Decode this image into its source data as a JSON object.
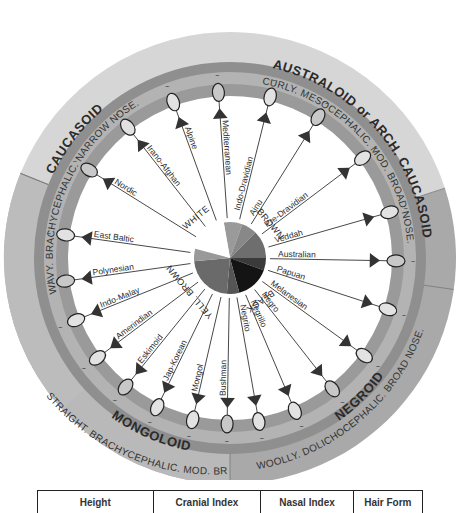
{
  "diagram": {
    "type": "circular race classification wheel",
    "center": [
      230,
      258
    ],
    "sectors": [
      {
        "id": "caucasoid",
        "title": "CAUCASOID",
        "description": "WAVY. BRACHYCEPHALIC. NARROW NOSE.",
        "color": "#d6d6d6",
        "start": -158,
        "end": -18
      },
      {
        "id": "australoid",
        "title": "AUSTRALOID or ARCH. CAUCASOID",
        "description": "CURLY. MESOCEPHALIC. MOD. BROAD NOSE.",
        "color": "#a9a9a9",
        "start": -18,
        "end": 90
      },
      {
        "id": "negroid",
        "title": "NEGROID",
        "description": "WOOLLY. DOLICHOCEPHALIC. BROAD NOSE.",
        "color": "#b9b9b9",
        "start": 90,
        "end": 180
      },
      {
        "id": "mongoloid",
        "title": "MONGOLOID",
        "description": "STRAIGHT. BRACHYCEPHALIC. MOD. BROAD NOSE",
        "color": "#bcbcbc",
        "start": 180,
        "end": 202
      }
    ],
    "skin_groups": [
      {
        "label": "WHITE"
      },
      {
        "label": "BROWN"
      },
      {
        "label": "BLACK"
      },
      {
        "label": "YELL. BROWN"
      }
    ],
    "races": [
      {
        "name": "Mediterranean",
        "group": "WHITE",
        "angle": -94
      },
      {
        "name": "Alpine",
        "group": "WHITE",
        "angle": -110
      },
      {
        "name": "Irano-Afghan",
        "group": "WHITE",
        "angle": -128
      },
      {
        "name": "Nordic",
        "group": "WHITE",
        "angle": -148
      },
      {
        "name": "East Baltic",
        "group": "WHITE",
        "angle": -172
      },
      {
        "name": "Indo-Dravidian",
        "group": "BROWN",
        "angle": -76
      },
      {
        "name": "Ainu",
        "group": "BROWN",
        "angle": -58
      },
      {
        "name": "Pre-Dravidian",
        "group": "BROWN",
        "angle": -37
      },
      {
        "name": "Veddah",
        "group": "BROWN",
        "angle": -16
      },
      {
        "name": "Australian",
        "group": "BROWN",
        "angle": 1
      },
      {
        "name": "Papuan",
        "group": "BLACK",
        "angle": 18
      },
      {
        "name": "Melanesian",
        "group": "BLACK",
        "angle": 36
      },
      {
        "name": "Negro",
        "group": "BLACK",
        "angle": 52
      },
      {
        "name": "Negrillo",
        "group": "BLACK",
        "angle": 67
      },
      {
        "name": "Negrito",
        "group": "BLACK",
        "angle": 80
      },
      {
        "name": "Bushman",
        "group": "BLACK",
        "angle": 91
      },
      {
        "name": "Mongol",
        "group": "YELL. BROWN",
        "angle": 103
      },
      {
        "name": "Jap-Korean",
        "group": "YELL. BROWN",
        "angle": 116
      },
      {
        "name": "Eskimoid",
        "group": "YELL. BROWN",
        "angle": 129
      },
      {
        "name": "Amerindian",
        "group": "YELL. BROWN",
        "angle": 143
      },
      {
        "name": "Indo-Malay",
        "group": "YELL. BROWN",
        "angle": 158
      },
      {
        "name": "Polynesian",
        "group": "YELL. BROWN",
        "angle": 172
      }
    ],
    "ring_colors": {
      "outer_band": "#8f8f8f",
      "mid_band": "#b3b3b3",
      "inner_band": "#9a9a9a",
      "disc": "#ffffff"
    }
  },
  "table": {
    "headers": [
      "Height",
      "Cranial Index",
      "Nasal Index",
      "Hair Form"
    ]
  }
}
